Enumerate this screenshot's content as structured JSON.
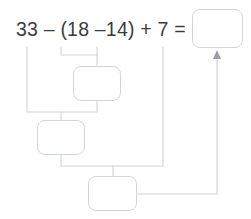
{
  "problem": {
    "expression_text": "33 – (18 – 14) + 7 =",
    "operands": [
      "33",
      "18",
      "14",
      "7"
    ],
    "operators": [
      "–",
      "–",
      "+"
    ],
    "equals_sign": "=",
    "open_paren": "(",
    "close_paren": ")"
  },
  "colors": {
    "text": "#3c3c3c",
    "box_border": "#d2d6db",
    "line": "#cfd3d8",
    "arrow": "#9aa0a6",
    "background": "#ffffff"
  },
  "answer_boxes": [
    {
      "id": "final-answer",
      "value": "",
      "placeholder": "",
      "x": 192,
      "y": 9,
      "w": 51,
      "h": 39
    },
    {
      "id": "step-1-paren",
      "value": "",
      "placeholder": "",
      "x": 73,
      "y": 66,
      "w": 48,
      "h": 35
    },
    {
      "id": "step-2-subtract",
      "value": "",
      "placeholder": "",
      "x": 37,
      "y": 120,
      "w": 48,
      "h": 35
    },
    {
      "id": "step-3-add",
      "value": "",
      "placeholder": "",
      "x": 88,
      "y": 176,
      "w": 49,
      "h": 35
    }
  ],
  "connectors": [
    {
      "id": "bracket-paren-group",
      "path": "M 61 47 L 61 55 L 97 55 L 97 47"
    },
    {
      "id": "paren-group-to-step1",
      "path": "M 97 55 L 97 66"
    },
    {
      "id": "step1-down-to-step2-join",
      "path": "M 97 101 L 97 112 L 27 112 L 27 47"
    },
    {
      "id": "step2-join-to-box",
      "path": "M 61 112 L 61 120"
    },
    {
      "id": "step2-down-to-step3-join",
      "path": "M 61 155 L 61 166 L 163 166 L 163 47"
    },
    {
      "id": "step3-join-to-box",
      "path": "M 113 166 L 113 176"
    },
    {
      "id": "step3-to-final-answer",
      "path": "M 137 194 L 217 194 L 217 55"
    }
  ],
  "arrow": {
    "id": "arrow-to-final-answer",
    "points": "217,50 213,59 221,59",
    "tip_x": 217,
    "tip_y": 50
  }
}
